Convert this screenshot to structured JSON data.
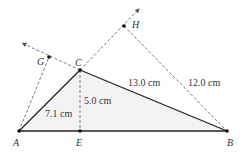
{
  "diagram": {
    "type": "geometry-triangle",
    "colors": {
      "stroke": "#222222",
      "dashed": "#555555",
      "fill": "#f3f3f3",
      "text": "#333333"
    },
    "points": {
      "A": {
        "label": "A",
        "x": 19,
        "y": 131
      },
      "B": {
        "label": "B",
        "x": 227,
        "y": 131
      },
      "C": {
        "label": "C",
        "x": 80,
        "y": 70
      },
      "E": {
        "label": "E",
        "x": 80,
        "y": 131
      },
      "G": {
        "label": "G",
        "x": 49,
        "y": 57
      },
      "H": {
        "label": "H",
        "x": 124,
        "y": 26
      }
    },
    "measurements": {
      "AC": "7.1 cm",
      "CE": "5.0 cm",
      "CB": "13.0 cm",
      "HB": "12.0 cm"
    }
  }
}
